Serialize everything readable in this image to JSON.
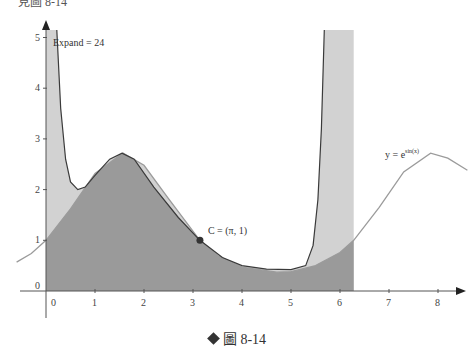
{
  "header_fragment": "見圖 8-14",
  "caption": {
    "symbol": "diamond",
    "text": "圖 8-14"
  },
  "annotations": {
    "expand": "Expand = 24",
    "point_label": "C = (π, 1)",
    "curve_label_base": "y = e",
    "curve_label_exp": "sin(x)"
  },
  "colors": {
    "dark_fill": "#9a9a9a",
    "light_fill": "#d2d2d2",
    "curve_dark": "#3a3a3a",
    "curve_light": "#9b9b9b",
    "axis": "#555555"
  },
  "chart_data": {
    "type": "area",
    "title": "",
    "xlabel": "",
    "ylabel": "",
    "x_ticks": [
      "0",
      "1",
      "2",
      "3",
      "4",
      "5",
      "6",
      "7",
      "8"
    ],
    "y_ticks": [
      "0",
      "1",
      "2",
      "3",
      "4",
      "5"
    ],
    "xlim": [
      -0.6,
      8.6
    ],
    "ylim": [
      -0.4,
      5.2
    ],
    "series": [
      {
        "name": "y = e^sin(x)",
        "style": "light-gray line",
        "x": [
          -0.6,
          -0.3,
          0,
          0.5,
          1.0,
          1.57,
          2.0,
          2.5,
          3.14,
          3.5,
          4.0,
          4.71,
          5.0,
          5.5,
          6.0,
          6.28,
          6.8,
          7.3,
          7.85,
          8.2,
          8.6
        ],
        "y": [
          0.57,
          0.74,
          1.0,
          1.62,
          2.32,
          2.72,
          2.48,
          1.82,
          1.0,
          0.7,
          0.47,
          0.37,
          0.38,
          0.5,
          0.76,
          1.0,
          1.65,
          2.35,
          2.72,
          2.62,
          2.38
        ]
      },
      {
        "name": "Taylor expansion about C (Expand = 24)",
        "style": "dark line, shaded",
        "x": [
          0.22,
          0.3,
          0.4,
          0.5,
          0.65,
          0.8,
          1.0,
          1.3,
          1.55,
          1.8,
          2.2,
          2.7,
          3.14,
          3.6,
          4.0,
          4.5,
          5.0,
          5.3,
          5.45,
          5.55,
          5.62,
          5.68
        ],
        "y": [
          5.2,
          3.6,
          2.6,
          2.15,
          2.0,
          2.05,
          2.28,
          2.6,
          2.72,
          2.6,
          2.05,
          1.45,
          1.0,
          0.66,
          0.5,
          0.43,
          0.42,
          0.5,
          0.9,
          1.8,
          3.2,
          5.2
        ]
      }
    ],
    "shaded_interval": [
      0,
      6.28
    ],
    "point": {
      "label": "C = (π, 1)",
      "x": 3.14159,
      "y": 1
    },
    "grid": false,
    "legend": "none"
  }
}
